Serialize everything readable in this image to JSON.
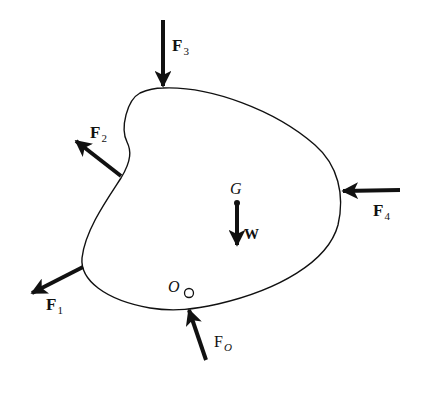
{
  "figure": {
    "colors": {
      "stroke": "#111111",
      "background": "#ffffff"
    }
  },
  "labels": {
    "F3": {
      "main": "F",
      "sub": "3"
    },
    "F2": {
      "main": "F",
      "sub": "2"
    },
    "F4": {
      "main": "F",
      "sub": "4"
    },
    "F1": {
      "main": "F",
      "sub": "1"
    },
    "FO": {
      "main": "F",
      "sub": "O"
    },
    "G": "G",
    "W": "W",
    "O": "O"
  }
}
